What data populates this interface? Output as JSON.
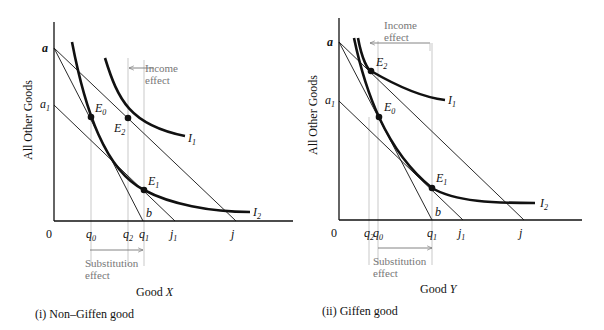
{
  "panels": [
    {
      "id": "non-giffen",
      "caption": "(i) Non–Giffen good",
      "xlabel": "Good X",
      "xlabel_var": "X",
      "ylabel": "All Other Goods",
      "origin_label": "0",
      "axis": {
        "x0": 54,
        "y0": 221,
        "ytop": 22,
        "xend": 293
      },
      "points": {
        "a": [
          54,
          48
        ],
        "a1": [
          54,
          105
        ],
        "b": [
          143,
          221
        ],
        "j1": [
          175,
          221
        ],
        "j": [
          236,
          221
        ],
        "E0": [
          91,
          117
        ],
        "E2": [
          128,
          118
        ],
        "E1": [
          144,
          190
        ]
      },
      "I1": "M105,58 C118,100 130,125 185,136",
      "I2": "M72,42 C85,110 105,170 144,190 C170,204 210,212 250,212",
      "labels": {
        "a": "a",
        "a1": "a",
        "a1_sub": "1",
        "b": "b",
        "E0": "E",
        "E0_sub": "0",
        "E2": "E",
        "E2_sub": "2",
        "E1": "E",
        "E1_sub": "1",
        "I1": "I",
        "I1_sub": "1",
        "I2": "I",
        "I2_sub": "2",
        "q_ticks": [
          {
            "x": 91,
            "name": "q",
            "sub": "0"
          },
          {
            "x": 128,
            "name": "q",
            "sub": "2"
          },
          {
            "x": 144,
            "name": "q",
            "sub": "1"
          },
          {
            "x": 175,
            "name": "j",
            "sub": "1"
          },
          {
            "x": 236,
            "name": "j",
            "sub": ""
          }
        ]
      },
      "income_effect": {
        "text1": "Income",
        "text2": "effect",
        "arrow_from": 142,
        "arrow_to": 128,
        "y": 68
      },
      "substitution_effect": {
        "text1": "Substitution",
        "text2": "effect",
        "arrow_from": 90,
        "arrow_to": 143,
        "y": 250
      }
    },
    {
      "id": "giffen",
      "caption": "(ii) Giffen good",
      "xlabel": "Good Y",
      "xlabel_var": "Y",
      "ylabel": "All Other Goods",
      "origin_label": "0",
      "axis": {
        "x0": 339,
        "y0": 220,
        "ytop": 18,
        "xend": 582
      },
      "points": {
        "a": [
          339,
          42
        ],
        "a1": [
          339,
          101
        ],
        "b": [
          432,
          220
        ],
        "j1": [
          463,
          220
        ],
        "j": [
          524,
          220
        ],
        "E0": [
          379,
          117
        ],
        "E2": [
          371,
          71
        ],
        "E1": [
          432,
          188
        ]
      },
      "I1": "M358,38 C362,60 368,70 371,71 C395,85 420,97 445,100",
      "I2": "M354,38 C365,90 385,150 432,188 C455,202 495,203 535,203",
      "labels": {
        "a": "a",
        "a1": "a",
        "a1_sub": "1",
        "b": "b",
        "E0": "E",
        "E0_sub": "0",
        "E2": "E",
        "E2_sub": "2",
        "E1": "E",
        "E1_sub": "1",
        "I1": "I",
        "I1_sub": "1",
        "I2": "I",
        "I2_sub": "2",
        "q_ticks": [
          {
            "x": 369,
            "name": "q",
            "sub": "2"
          },
          {
            "x": 378,
            "name": "q",
            "sub": "0"
          },
          {
            "x": 432,
            "name": "q",
            "sub": "1"
          },
          {
            "x": 463,
            "name": "j",
            "sub": "1"
          },
          {
            "x": 524,
            "name": "j",
            "sub": ""
          }
        ]
      },
      "income_effect": {
        "text1": "Income",
        "text2": "effect",
        "arrow_from": 430,
        "arrow_to": 370,
        "y": 43
      },
      "substitution_effect": {
        "text1": "Substitution",
        "text2": "effect",
        "arrow_from": 378,
        "arrow_to": 432,
        "y": 248
      }
    }
  ],
  "colors": {
    "ink": "#111111",
    "grey": "#777777",
    "guide": "#bbbbbb"
  }
}
